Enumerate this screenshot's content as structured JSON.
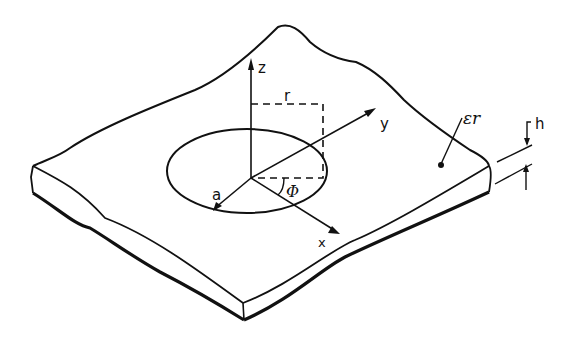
{
  "diagram": {
    "labels": {
      "z_axis": "z",
      "y_axis": "y",
      "x_axis": "x",
      "radius_r": "r",
      "disk_radius": "a",
      "angle": "Φ",
      "permittivity": "εr",
      "thickness": "h"
    },
    "colors": {
      "ink": "#111111",
      "background": "#ffffff"
    }
  }
}
